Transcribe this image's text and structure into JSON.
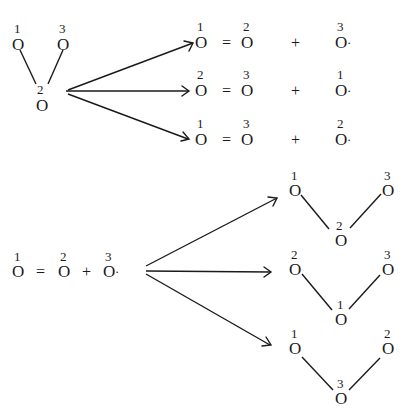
{
  "diagram": {
    "atom_symbol": "O",
    "radical_dot": "·",
    "equals": "=",
    "plus": "+",
    "top": {
      "source": {
        "type": "bent-triatomic",
        "labels": [
          "1",
          "2",
          "3"
        ],
        "positions": [
          {
            "label": "1",
            "x": 18,
            "y": 70
          },
          {
            "label": "2",
            "x": 42,
            "y": 110
          },
          {
            "label": "3",
            "x": 66,
            "y": 70
          }
        ]
      },
      "products": [
        {
          "double_bond": [
            "1",
            "2"
          ],
          "radical": "3"
        },
        {
          "double_bond": [
            "2",
            "3"
          ],
          "radical": "1"
        },
        {
          "double_bond": [
            "1",
            "3"
          ],
          "radical": "2"
        }
      ]
    },
    "bottom": {
      "source": {
        "double_bond": [
          "1",
          "2"
        ],
        "radical": "3"
      },
      "products": [
        {
          "type": "bent-triatomic",
          "left": "1",
          "center": "2",
          "right": "3"
        },
        {
          "type": "bent-triatomic",
          "left": "2",
          "center": "1",
          "right": "3"
        },
        {
          "type": "bent-triatomic",
          "left": "1",
          "center": "3",
          "right": "2"
        }
      ]
    },
    "arrows": {
      "top": [
        {
          "from": [
            66,
            91
          ],
          "to": [
            193,
            43
          ]
        },
        {
          "from": [
            66,
            91
          ],
          "to": [
            188,
            91
          ]
        },
        {
          "from": [
            66,
            91
          ],
          "to": [
            188,
            139
          ]
        }
      ],
      "bottom": [
        {
          "from": [
            146,
            267
          ],
          "to": [
            277,
            198
          ]
        },
        {
          "from": [
            146,
            267
          ],
          "to": [
            270,
            272
          ]
        },
        {
          "from": [
            146,
            267
          ],
          "to": [
            270,
            345
          ]
        }
      ]
    }
  }
}
